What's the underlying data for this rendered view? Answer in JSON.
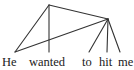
{
  "diagram": {
    "type": "dependency-tree",
    "line_color": "#333333",
    "text_color": "#1a1a1a",
    "background": "#ffffff",
    "nodes": [
      {
        "id": "root",
        "x": 49,
        "y": 5
      },
      {
        "id": "n2",
        "x": 108,
        "y": 19
      }
    ],
    "words": [
      {
        "text": "He",
        "x": 2,
        "anchor_x": 15
      },
      {
        "text": "wanted",
        "x": 29,
        "anchor_x": 49
      },
      {
        "text": "to",
        "x": 82,
        "anchor_x": 89
      },
      {
        "text": "hit",
        "x": 99,
        "anchor_x": 107
      },
      {
        "text": "me",
        "x": 118,
        "anchor_x": 120
      }
    ],
    "edges": [
      {
        "from": "root",
        "to": "He"
      },
      {
        "from": "root",
        "to": "wanted"
      },
      {
        "from": "root",
        "to": "n2"
      },
      {
        "from": "n2",
        "to": "He"
      },
      {
        "from": "n2",
        "to": "to"
      },
      {
        "from": "n2",
        "to": "hit"
      },
      {
        "from": "n2",
        "to": "me"
      }
    ]
  }
}
